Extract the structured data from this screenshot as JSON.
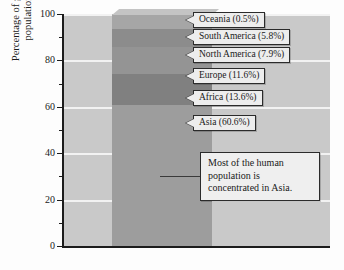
{
  "chart_data": {
    "type": "bar",
    "subtype": "stacked-100-percent",
    "title": "",
    "xlabel": "",
    "ylabel": "Percentage of global population",
    "ylim": [
      0,
      100
    ],
    "grid": true,
    "legend": "none",
    "categories": [
      "Global population"
    ],
    "orientation": "vertical",
    "stack_order_bottom_to_top": [
      "Asia",
      "Africa",
      "Europe",
      "North America",
      "South America",
      "Oceania"
    ],
    "series": [
      {
        "name": "Asia",
        "values": [
          60.6
        ],
        "color": "#9d9d9d",
        "cumulative_top": 60.6
      },
      {
        "name": "Africa",
        "values": [
          13.6
        ],
        "color": "#808080",
        "cumulative_top": 74.2
      },
      {
        "name": "Europe",
        "values": [
          11.6
        ],
        "color": "#949494",
        "cumulative_top": 85.8
      },
      {
        "name": "North America",
        "values": [
          7.9
        ],
        "color": "#8c8c8c",
        "cumulative_top": 93.7
      },
      {
        "name": "South America",
        "values": [
          5.8
        ],
        "color": "#a6a6a6",
        "cumulative_top": 99.5
      },
      {
        "name": "Oceania",
        "values": [
          0.5
        ],
        "color": "#b5b5b5",
        "cumulative_top": 100.0
      }
    ],
    "yticks_major": [
      0,
      20,
      40,
      60,
      80,
      100
    ],
    "ytick_labels": [
      "0",
      "20",
      "40",
      "60",
      "80",
      "100"
    ],
    "yticks_minor": [
      10,
      30,
      50,
      70,
      90
    ],
    "annotations": [
      {
        "id": "oceania",
        "text": "Oceania (0.5%)"
      },
      {
        "id": "south-america",
        "text": "South America (5.8%)"
      },
      {
        "id": "north-america",
        "text": "North America (7.9%)"
      },
      {
        "id": "europe",
        "text": "Europe (11.6%)"
      },
      {
        "id": "africa",
        "text": "Africa (13.6%)"
      },
      {
        "id": "asia",
        "text": "Asia (60.6%)"
      },
      {
        "id": "note",
        "text": "Most of the human population is concentrated in Asia."
      }
    ]
  },
  "axis": {
    "y_title": "Percentage of global population",
    "ticks": [
      {
        "value": 100,
        "label": "100"
      },
      {
        "value": 80,
        "label": "80"
      },
      {
        "value": 60,
        "label": "60"
      },
      {
        "value": 40,
        "label": "40"
      },
      {
        "value": 20,
        "label": "20"
      },
      {
        "value": 0,
        "label": "0"
      }
    ]
  },
  "callouts": {
    "oceania": "Oceania (0.5%)",
    "south_america": "South America (5.8%)",
    "north_america": "North America (7.9%)",
    "europe": "Europe (11.6%)",
    "africa": "Africa (13.6%)",
    "asia": "Asia (60.6%)",
    "note": "Most of the human population is concentrated in Asia."
  },
  "colors": {
    "plot_background": "#c9c9c9",
    "gridline": "#f2f2f2",
    "axis": "#1c1c1c",
    "callout_fill": "#ededed",
    "callout_border": "#2b2b2b",
    "bar_side": "#3b3b3b"
  }
}
